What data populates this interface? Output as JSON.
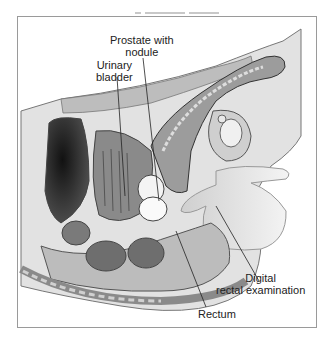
{
  "figure": {
    "type": "anatomical illustration",
    "palette": {
      "ink": "#222222",
      "frame": "#9a9a9a",
      "dark": "#2a2a2a",
      "mid": "#8a8a8a",
      "light": "#d8d8d8",
      "paper": "#ffffff"
    }
  },
  "labels": {
    "prostate_line1": "Prostate with",
    "prostate_line2": "nodule",
    "bladder_line1": "Urinary",
    "bladder_line2": "bladder",
    "dre_line1": "Digital",
    "dre_line2": "rectal examination",
    "rectum": "Rectum"
  }
}
